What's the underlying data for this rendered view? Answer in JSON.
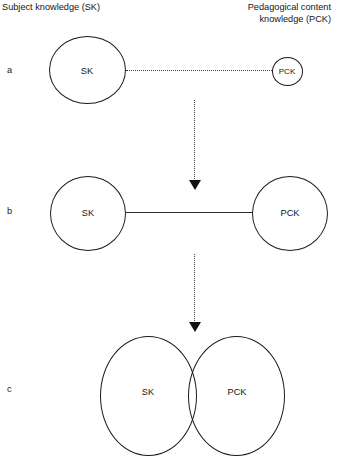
{
  "figure": {
    "headers": {
      "left": "Subject knowledge (SK)",
      "right_line1": "Pedagogical content",
      "right_line2": "knowledge (PCK)"
    },
    "rows": [
      {
        "letter": "a",
        "left_circle_label": "SK",
        "right_circle_label": "PCK",
        "connector": "dotted-line"
      },
      {
        "letter": "b",
        "left_circle_label": "SK",
        "right_circle_label": "PCK",
        "connector": "solid-line"
      },
      {
        "letter": "c",
        "left_circle_label": "SK",
        "right_circle_label": "PCK",
        "connector": "overlapping-circles"
      }
    ],
    "arrows": [
      {
        "name": "a-to-b",
        "style": "dotted-down-arrow"
      },
      {
        "name": "b-to-c",
        "style": "dotted-down-arrow"
      }
    ],
    "colors": {
      "stroke": "#1c1c1c",
      "text": "#151515",
      "background": "#ffffff"
    }
  }
}
